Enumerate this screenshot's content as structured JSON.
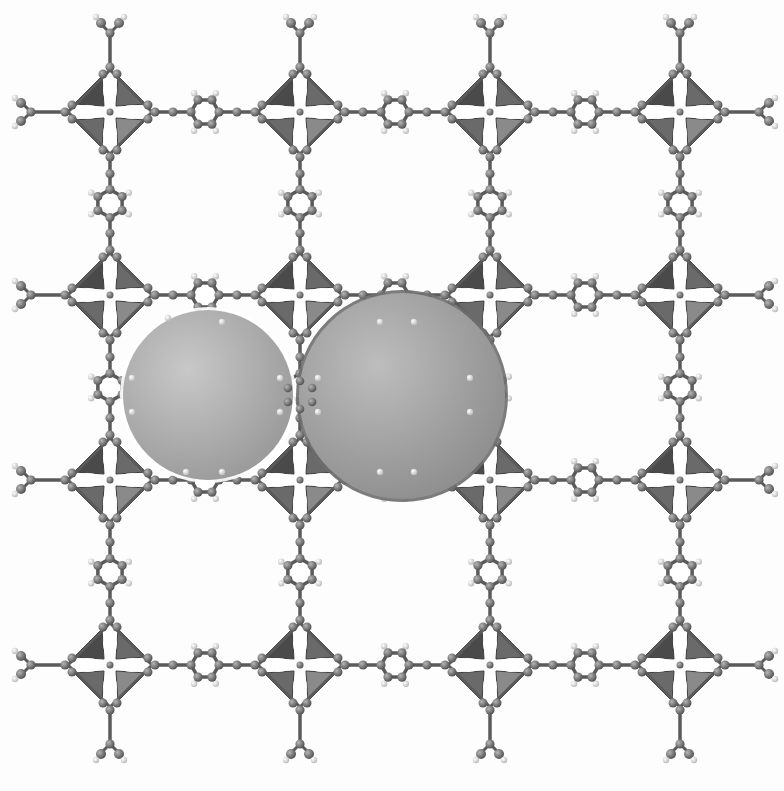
{
  "figure": {
    "grid": {
      "columns": [
        110,
        300,
        490,
        680
      ],
      "rows": [
        112,
        295,
        480,
        665
      ]
    },
    "node": {
      "type": "Zn4O-cluster-octahedron",
      "half_size": 42,
      "fill": "#6a6a6a",
      "dark": "#4a4a4a",
      "light": "#8a8a8a"
    },
    "linker": {
      "type": "benzene-ring",
      "ring_radius": 14,
      "atom_color": "#777777",
      "hydrogen_color": "#f0f0f0",
      "bond_color": "#5a5a5a"
    },
    "pore_spheres": [
      {
        "cx": 208,
        "cy": 395,
        "r": 85,
        "fill": "#9a9a9a",
        "highlight": "#c8c8c8",
        "outline": "#ffffff"
      },
      {
        "cx": 402,
        "cy": 396,
        "r": 103,
        "fill": "#8e8e8e",
        "highlight": "#bdbdbd",
        "outline": "#6e6e6e"
      }
    ],
    "background": "#fdfdfd"
  }
}
